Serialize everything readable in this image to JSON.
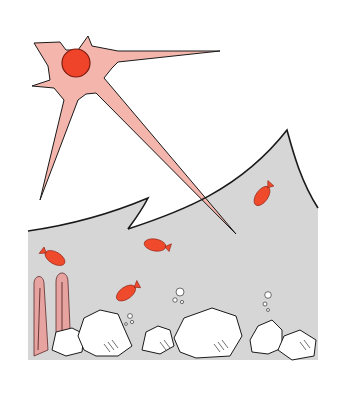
{
  "scene": {
    "description": "Hand-drawn illustration of a sun with long rays shining down onto a wavy sea; underwater there are red fish, pink coral and white rocks with bubbles.",
    "colors": {
      "background": "#ffffff",
      "water": "#d6d6d6",
      "sun_ray": "#f4b6ac",
      "sun_core": "#f0442a",
      "fish": "#f04a2c",
      "coral": "#e7a3a0",
      "rock": "#ffffff",
      "outline": "#1a1a1a"
    },
    "sun": {
      "cx": 76,
      "cy": 63,
      "core_radius": 14
    },
    "fish": [
      {
        "name": "fish-1",
        "x": 262,
        "y": 196
      },
      {
        "name": "fish-2",
        "x": 155,
        "y": 245
      },
      {
        "name": "fish-3",
        "x": 55,
        "y": 258
      },
      {
        "name": "fish-4",
        "x": 126,
        "y": 293
      }
    ],
    "coral_count": 2,
    "rock_count": 6
  }
}
